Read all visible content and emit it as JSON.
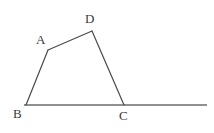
{
  "figure": {
    "background_color": "#ffffff",
    "labels": {
      "A": "A",
      "B": "B",
      "C": "C",
      "D": "D"
    },
    "label_color": "#3a3a3a",
    "stroke_colors": {
      "polygon_edges": "#4a4a4a",
      "base_line": "#6b6b6b"
    },
    "stroke_widths": {
      "polygon_edges": 1.2,
      "base_line": 1.6
    },
    "points": {
      "A": {
        "x": 48,
        "y": 50
      },
      "B": {
        "x": 26,
        "y": 105
      },
      "C": {
        "x": 124,
        "y": 105
      },
      "D": {
        "x": 92,
        "y": 31
      }
    },
    "base_line": {
      "x1": 24,
      "y1": 105,
      "x2": 207,
      "y2": 105
    },
    "segments": [
      {
        "name": "B-A",
        "from": "B",
        "to": "A"
      },
      {
        "name": "A-D",
        "from": "A",
        "to": "D"
      },
      {
        "name": "D-C",
        "from": "D",
        "to": "C"
      }
    ]
  }
}
